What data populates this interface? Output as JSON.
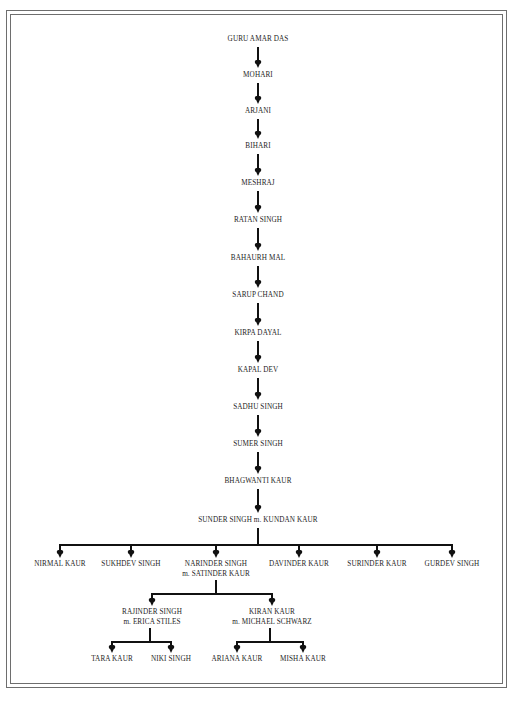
{
  "colors": {
    "line": "#111111",
    "text": "#1e1e1e",
    "border": "#6e6e6e",
    "background": "#ffffff"
  },
  "lineage": [
    "GURU AMAR DAS",
    "MOHARI",
    "ARJANI",
    "BIHARI",
    "MESHRAJ",
    "RATAN SINGH",
    "BAHAURH MAL",
    "SARUP CHAND",
    "KIRPA DAYAL",
    "KAPAL DEV",
    "SADHU SINGH",
    "SUMER SINGH",
    "BHAGWANTI KAUR",
    "SUNDER SINGH m. KUNDAN KAUR"
  ],
  "children": [
    {
      "name": "NIRMAL KAUR"
    },
    {
      "name": "SUKHDEV SINGH"
    },
    {
      "name": "NARINDER SINGH",
      "spouse": "m. SATINDER KAUR"
    },
    {
      "name": "DAVINDER KAUR"
    },
    {
      "name": "SURINDER KAUR"
    },
    {
      "name": "GURDEV SINGH"
    }
  ],
  "grandchildren": [
    {
      "name": "RAJINDER SINGH",
      "spouse": "m. ERICA STILES",
      "children": [
        "TARA KAUR",
        "NIKI SINGH"
      ]
    },
    {
      "name": "KIRAN KAUR",
      "spouse": "m. MICHAEL SCHWARZ",
      "children": [
        "ARIANA KAUR",
        "MISHA KAUR"
      ]
    }
  ]
}
